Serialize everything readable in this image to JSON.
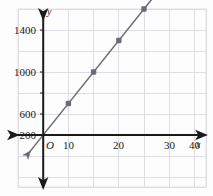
{
  "figure": {
    "background_color": "#fdfdfd",
    "grid_color": "#d9d9e0",
    "axis_color": "#1a1a1a",
    "line_color": "#6b6b78",
    "point_color": "#6b6b78",
    "origin_label": "O",
    "x_axis_name": "x",
    "y_axis_name": "y"
  },
  "chart_data": {
    "type": "line",
    "title": "",
    "subtitle": "",
    "xlabel": "x",
    "ylabel": "y",
    "legend": [],
    "legend_position": "none",
    "grid": true,
    "xlim": [
      -7,
      48
    ],
    "ylim": [
      -300,
      1560
    ],
    "x_ticks": [
      10,
      20,
      30,
      40
    ],
    "x_tick_labels": [
      "10",
      "20",
      "30",
      "40"
    ],
    "y_ticks": [
      200,
      600,
      1000,
      1400
    ],
    "y_tick_labels": [
      "200",
      "600",
      "1000",
      "1400"
    ],
    "x_gridline_step": 10,
    "y_gridline_step": 200,
    "series": [
      {
        "name": "line",
        "relationship": "y = 30x",
        "slope": 30,
        "intercept": 0,
        "x": [
          10,
          20,
          30,
          40
        ],
        "values": [
          300,
          600,
          900,
          1200
        ],
        "marked_points": [
          {
            "x": 10,
            "y": 300
          },
          {
            "x": 20,
            "y": 600
          },
          {
            "x": 30,
            "y": 900
          },
          {
            "x": 40,
            "y": 1200
          }
        ],
        "arrow_start": {
          "x": -6,
          "y": -180
        },
        "arrow_end": {
          "x": 47,
          "y": 1410
        }
      }
    ]
  },
  "axes": {
    "x_arrow_left": true,
    "x_arrow_right": true,
    "y_arrow_up": true,
    "y_arrow_down": true
  }
}
